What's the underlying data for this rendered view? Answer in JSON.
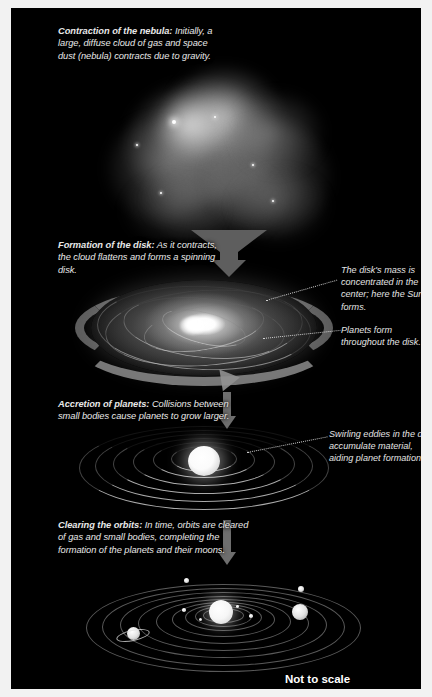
{
  "figure": {
    "scale_note": "Not to scale",
    "background_color": "#000000",
    "text_color": "#e8e8e8"
  },
  "stages": [
    {
      "id": "contraction",
      "heading": "Contraction of the nebula:",
      "body": " Initially, a large, diffuse cloud of gas and space dust (nebula) contracts due to gravity.",
      "visual": "diffuse-nebula-cloud"
    },
    {
      "id": "disk-formation",
      "heading": "Formation of the disk:",
      "body": "  As it contracts, the cloud flattens and forms a spinning disk.",
      "visual": "spinning-protoplanetary-disk"
    },
    {
      "id": "accretion",
      "heading": "Accretion of planets:",
      "body": " Collisions between small bodies cause planets to grow larger.",
      "visual": "concentric-accretion-rings"
    },
    {
      "id": "clearing",
      "heading": "Clearing the orbits:",
      "body": " In time, orbits are cleared of gas and small bodies, completing the formation of the planets and their moons.",
      "visual": "finished-solar-system"
    }
  ],
  "annotations": [
    {
      "id": "sun-forms",
      "text": "The disk's mass is concentrated in the center; here the Sun forms.",
      "points_to": "disk-center"
    },
    {
      "id": "planets-form",
      "text": "Planets form throughout the disk.",
      "points_to": "disk-outer-region"
    },
    {
      "id": "swirling-eddies",
      "text": "Swirling eddies in the disk accumulate material, aiding planet formation.",
      "points_to": "accretion-ring"
    }
  ],
  "solar_system": {
    "center_body": "Sun",
    "orbit_count": 9,
    "visible_planets": [
      "Mercury",
      "Venus",
      "Earth",
      "Mars",
      "Jupiter",
      "Saturn",
      "Uranus",
      "Neptune"
    ],
    "ringed_planet": "Saturn"
  },
  "colors": {
    "plate": "#000000",
    "text": "#e8e8e8",
    "arrow": "#6e6e6e",
    "ribbon": "#8c8c8c",
    "orbit_line": "#c3c3c3",
    "frame": "#f2f2f2"
  }
}
